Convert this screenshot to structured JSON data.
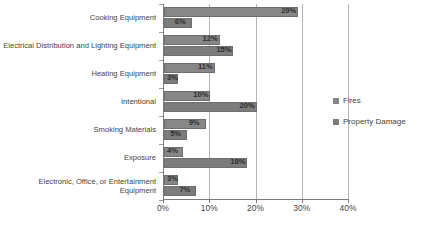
{
  "chart_data": {
    "type": "bar",
    "orientation": "horizontal",
    "title": "",
    "subtitle": "",
    "xlabel": "",
    "ylabel": "",
    "xlim": [
      0,
      40
    ],
    "xticks": [
      "0%",
      "10%",
      "20%",
      "30%",
      "40%"
    ],
    "xtick_values": [
      0,
      10,
      20,
      30,
      40
    ],
    "grid": true,
    "grid_axis": "x",
    "legend_position": "right",
    "value_suffix": "%",
    "categories": [
      "Cooking Equipment",
      "Electrical Distribution and Lighting Equipment",
      "Heating Equipment",
      "Intentional",
      "Smoking Materials",
      "Exposure",
      "Electronic, Office, or Entertainment Equipment"
    ],
    "series": [
      {
        "name": "Fires",
        "color": "#878787",
        "values": [
          29,
          12,
          11,
          10,
          9,
          4,
          3
        ],
        "labels": [
          "29%",
          "12%",
          "11%",
          "10%",
          "9%",
          "4%",
          "3%"
        ]
      },
      {
        "name": "Property Damage",
        "color": "#7c7c7c",
        "values": [
          6,
          15,
          3,
          20,
          5,
          18,
          7
        ],
        "labels": [
          "6%",
          "15%",
          "3%",
          "20%",
          "5%",
          "18%",
          "7%"
        ]
      }
    ]
  },
  "legend": {
    "items": [
      {
        "label": "Fires",
        "color": "#878787"
      },
      {
        "label": "Property Damage",
        "color": "#7c7c7c"
      }
    ]
  }
}
